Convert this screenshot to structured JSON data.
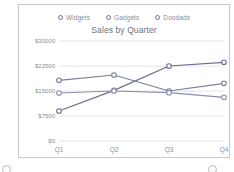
{
  "card": {
    "border_color": "#c9c9c9"
  },
  "legend": {
    "position": "top-center",
    "items": [
      {
        "label": "Widgets",
        "marker": "open-circle-marker",
        "color": "#6b6f8e"
      },
      {
        "label": "Gadgets",
        "marker": "open-circle-marker",
        "color": "#6b6f8e"
      },
      {
        "label": "Doodads",
        "marker": "open-circle-marker",
        "color": "#6b6f8e"
      }
    ]
  },
  "chart_data": {
    "type": "line",
    "title": "Sales by Quarter",
    "xlabel": "",
    "ylabel": "",
    "categories": [
      "Q1",
      "Q2",
      "Q3",
      "Q4"
    ],
    "ytick_labels": [
      "$30000",
      "$22500",
      "$15000",
      "$7500",
      "$0"
    ],
    "ytick_values": [
      30000,
      22500,
      15000,
      7500,
      0
    ],
    "ylim": [
      0,
      30000
    ],
    "grid": "horizontal",
    "series": [
      {
        "name": "Widgets",
        "color": "#6b6f8e",
        "values": [
          9000,
          15200,
          22500,
          23600
        ]
      },
      {
        "name": "Gadgets",
        "color": "#7a7f9c",
        "values": [
          18200,
          19800,
          15000,
          17300
        ]
      },
      {
        "name": "Doodads",
        "color": "#8a8ea8",
        "values": [
          14400,
          15000,
          14500,
          13100
        ]
      }
    ],
    "marker": "open-circle-marker",
    "marker_face": "#ffffff"
  },
  "decorations": {
    "orbs": [
      {
        "name": "left-orb",
        "x": 2,
        "y": 165
      },
      {
        "name": "right-orb",
        "x": 208,
        "y": 165
      }
    ]
  }
}
